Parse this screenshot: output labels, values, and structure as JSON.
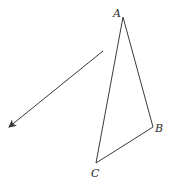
{
  "diagram": {
    "type": "geometry-figure",
    "triangle": {
      "vertices": [
        {
          "label": "A",
          "x": 123,
          "y": 17,
          "label_x": 113,
          "label_y": 17
        },
        {
          "label": "B",
          "x": 153,
          "y": 127,
          "label_x": 155,
          "label_y": 132
        },
        {
          "label": "C",
          "x": 96,
          "y": 163,
          "label_x": 91,
          "label_y": 177
        }
      ],
      "stroke": "#3a3a3a"
    },
    "arrow": {
      "x1": 103,
      "y1": 51,
      "x2": 8,
      "y2": 128,
      "stroke": "#3a3a3a"
    }
  }
}
